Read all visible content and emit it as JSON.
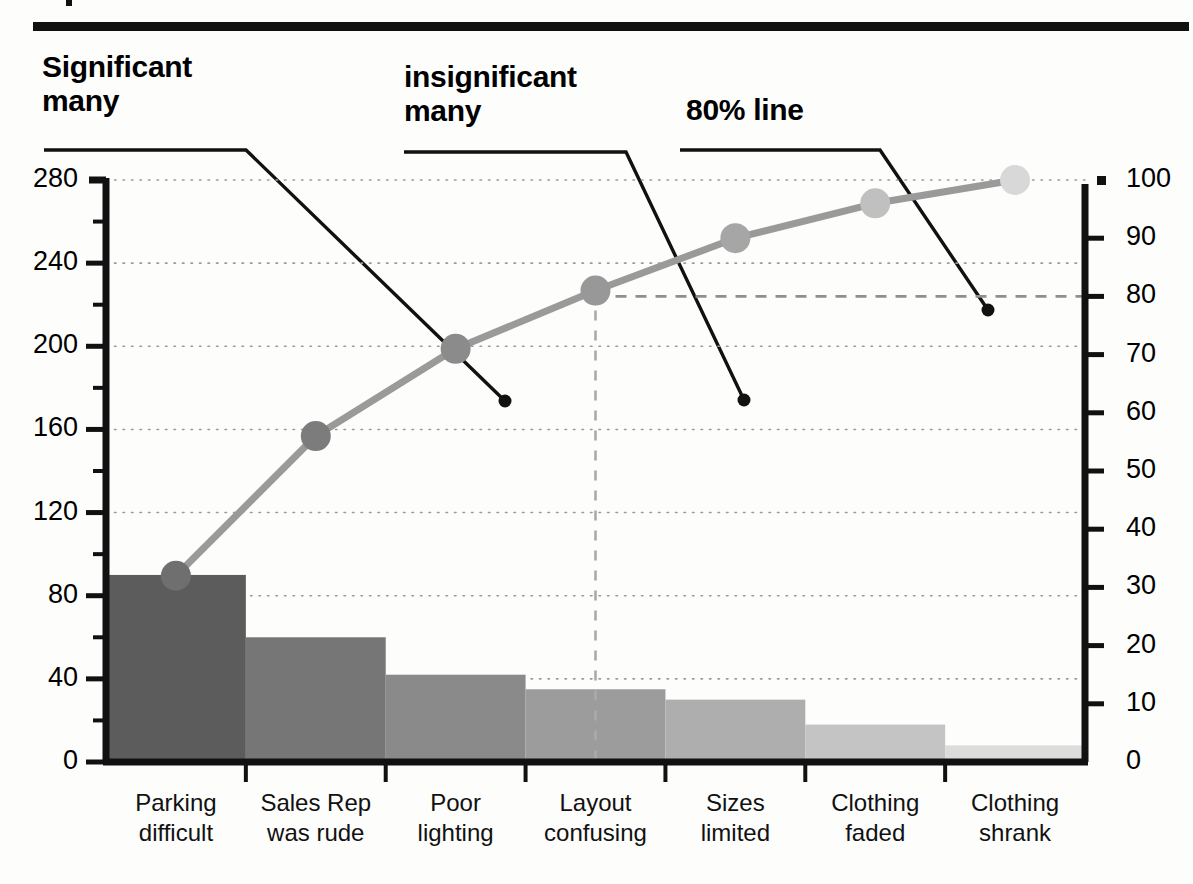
{
  "header": {
    "rule_color": "#111111",
    "tick_mark": "corner-tick"
  },
  "annotations": [
    {
      "id": "significant-many",
      "label": "Significant\nmany",
      "leader_from_x": 44,
      "leader_to_x": 246,
      "leader_y": 150,
      "tip_x": 505,
      "tip_y": 401
    },
    {
      "id": "insignificant-many",
      "label": "insignificant\nmany",
      "leader_from_x": 404,
      "leader_to_x": 626,
      "leader_y": 152,
      "tip_x": 744,
      "tip_y": 400
    },
    {
      "id": "eighty-percent-line",
      "label": "80% line",
      "leader_from_x": 680,
      "leader_to_x": 880,
      "leader_y": 150,
      "tip_x": 988,
      "tip_y": 310
    }
  ],
  "chart_data": {
    "type": "bar",
    "title": "",
    "subtitle": "",
    "xlabel": "",
    "ylabel": "",
    "categories": [
      "Parking\ndifficult",
      "Sales Rep\nwas rude",
      "Poor\nlighting",
      "Layout\nconfusing",
      "Sizes\nlimited",
      "Clothing\nfaded",
      "Clothing\nshrank"
    ],
    "series": [
      {
        "name": "Frequency",
        "type": "bar",
        "axis": "left",
        "values": [
          90,
          60,
          42,
          35,
          30,
          18,
          8
        ],
        "colors": [
          "#5c5c5c",
          "#767676",
          "#8a8a8a",
          "#9c9c9c",
          "#aeaeae",
          "#c4c4c4",
          "#dcdcdc"
        ]
      },
      {
        "name": "Cumulative %",
        "type": "line",
        "axis": "right",
        "values": [
          32,
          56,
          71,
          81,
          90,
          96,
          100
        ],
        "line_color": "#9a9a9a",
        "marker_colors": [
          "#6f6f6f",
          "#7c7c7c",
          "#8b8b8b",
          "#989898",
          "#a6a6a6",
          "#c0c0c0",
          "#d8d8d8"
        ]
      }
    ],
    "y_left": {
      "min": 0,
      "max": 280,
      "major_ticks": [
        0,
        40,
        80,
        120,
        160,
        200,
        240,
        280
      ],
      "minor_tick_step": 20,
      "labels": [
        "0",
        "40",
        "80",
        "120",
        "160",
        "200",
        "240",
        "280"
      ]
    },
    "y_right": {
      "min": 0,
      "max": 100,
      "major_ticks": [
        0,
        10,
        20,
        30,
        40,
        50,
        60,
        70,
        80,
        90,
        100
      ],
      "labels": [
        "0",
        "10",
        "20",
        "30",
        "40",
        "50",
        "60",
        "70",
        "80",
        "90",
        "100"
      ]
    },
    "grid": {
      "horizontal": true,
      "style": "dotted",
      "at_left_values": [
        40,
        80,
        120,
        160,
        200,
        240,
        280
      ]
    },
    "reference_lines": [
      {
        "name": "80-percent-horizontal",
        "axis": "right",
        "value": 80,
        "style": "dashed",
        "color": "#8f8f8f"
      },
      {
        "name": "80-percent-vertical",
        "at_category_index": 3,
        "style": "dashed",
        "color": "#aaaaaa"
      }
    ],
    "legend": {
      "visible": false,
      "position": "none"
    }
  }
}
